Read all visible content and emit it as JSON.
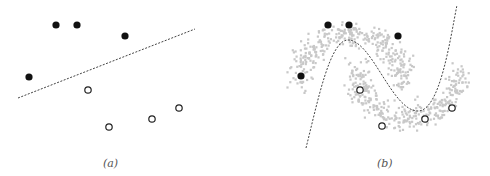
{
  "figure": {
    "panels": [
      {
        "id": "a",
        "caption": "(a)",
        "caption_pos": [
          103,
          157
        ],
        "labeled_positive": [
          [
            29,
            77
          ],
          [
            56,
            25
          ],
          [
            77,
            25
          ],
          [
            125,
            36
          ]
        ],
        "labeled_negative": [
          [
            88,
            90
          ],
          [
            109,
            127
          ],
          [
            152,
            119
          ],
          [
            179,
            108
          ]
        ],
        "boundary": "M18,98 L195,29"
      },
      {
        "id": "b",
        "caption": "(b)",
        "caption_pos": [
          377,
          157
        ],
        "labeled_positive": [
          [
            301,
            76
          ],
          [
            328,
            25
          ],
          [
            349,
            25
          ],
          [
            398,
            36
          ]
        ],
        "labeled_negative": [
          [
            360,
            90
          ],
          [
            382,
            126
          ],
          [
            425,
            119
          ],
          [
            452,
            108
          ]
        ],
        "boundary": "M306,148 C318,100 330,40 348,40 C372,40 392,111 418,111 C440,111 450,40 457,5",
        "unlabeled_cloud": {
          "count": 700,
          "color": "#c8c8c8",
          "upper_moon": {
            "cx": 350,
            "cy": 82,
            "rx": 52,
            "ry": 55,
            "start_deg": 180,
            "end_deg": 360
          },
          "lower_moon": {
            "cx": 407,
            "cy": 68,
            "rx": 52,
            "ry": 55,
            "start_deg": 0,
            "end_deg": 180
          },
          "spread": 8
        }
      }
    ],
    "colors": {
      "positive_fill": "#111111",
      "negative_stroke": "#222222",
      "boundary": "#444444"
    }
  }
}
